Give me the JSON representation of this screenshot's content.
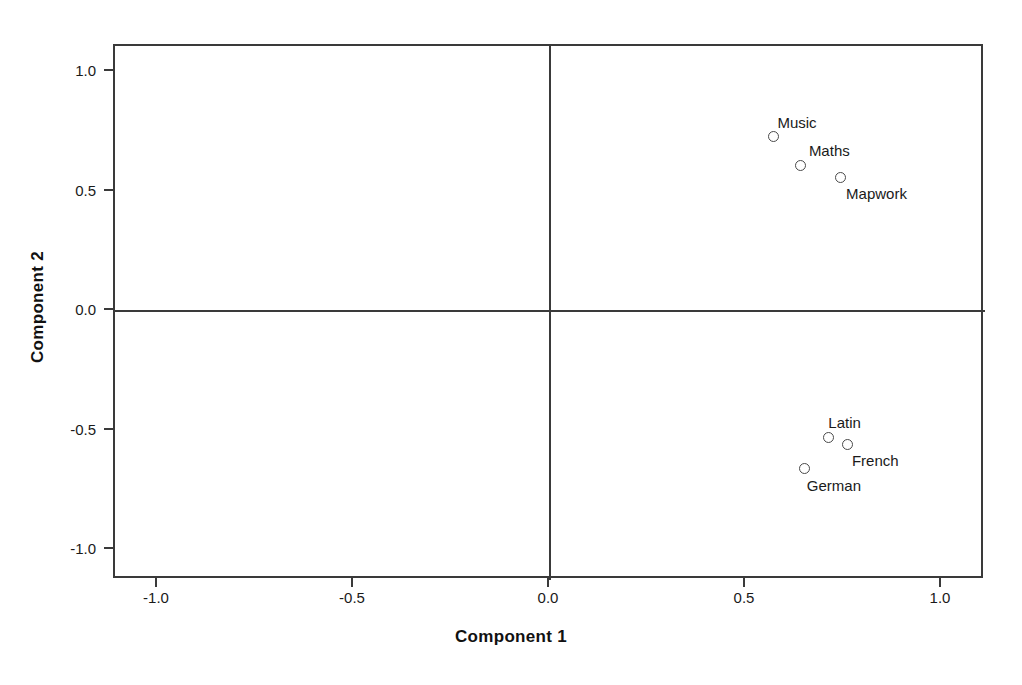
{
  "chart_data": {
    "type": "scatter",
    "title": "",
    "xlabel": "Component 1",
    "ylabel": "Component 2",
    "xlim": [
      -1.1,
      1.1
    ],
    "ylim": [
      -1.1,
      1.1
    ],
    "grid": false,
    "legend": "none",
    "reference_lines": {
      "x": 0.0,
      "y": 0.0
    },
    "xticks": [
      "-1.0",
      "-0.5",
      "0.0",
      "0.5",
      "1.0"
    ],
    "xtick_values": [
      -1.0,
      -0.5,
      0.0,
      0.5,
      1.0
    ],
    "yticks": [
      "1.0",
      "0.5",
      "0.0",
      "-0.5",
      "-1.0"
    ],
    "ytick_values": [
      1.0,
      0.5,
      0.0,
      -0.5,
      -1.0
    ],
    "marker": "open-circle",
    "points": [
      {
        "label": "Music",
        "x": 0.57,
        "y": 0.73,
        "label_dx": 4,
        "label_dy": -22
      },
      {
        "label": "Maths",
        "x": 0.64,
        "y": 0.61,
        "label_dx": 8,
        "label_dy": -22
      },
      {
        "label": "Mapwork",
        "x": 0.74,
        "y": 0.56,
        "label_dx": 6,
        "label_dy": 9
      },
      {
        "label": "Latin",
        "x": 0.71,
        "y": -0.53,
        "label_dx": 0,
        "label_dy": -23
      },
      {
        "label": "French",
        "x": 0.76,
        "y": -0.56,
        "label_dx": 4,
        "label_dy": 8
      },
      {
        "label": "German",
        "x": 0.65,
        "y": -0.66,
        "label_dx": 2,
        "label_dy": 9
      }
    ]
  }
}
